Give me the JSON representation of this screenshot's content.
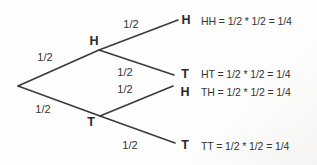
{
  "colors": {
    "line": "#3a3a3a",
    "text": "#333333",
    "background": "#fefefe"
  },
  "tree": {
    "branches_level1": [
      {
        "probability": "1/2",
        "label": "H"
      },
      {
        "probability": "1/2",
        "label": "T"
      }
    ],
    "branches_level2": [
      {
        "probability": "1/2",
        "label": "H",
        "outcome": "HH = 1/2 * 1/2 = 1/4"
      },
      {
        "probability": "1/2",
        "label": "T",
        "outcome": "HT = 1/2 * 1/2 = 1/4"
      },
      {
        "probability": "1/2",
        "label": "H",
        "outcome": "TH = 1/2 * 1/2 = 1/4"
      },
      {
        "probability": "1/2",
        "label": "T",
        "outcome": "TT = 1/2 * 1/2 = 1/4"
      }
    ]
  }
}
